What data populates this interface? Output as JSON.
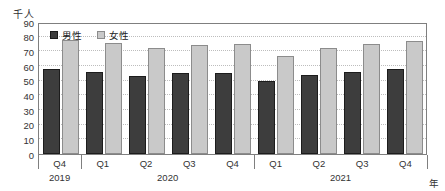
{
  "figure": {
    "unit_label": "千人",
    "axis_unit_label": "年"
  },
  "legend": {
    "items": [
      {
        "label": "男性",
        "color": "#3d3d3d",
        "border": "#1c1c1c"
      },
      {
        "label": "女性",
        "color": "#c9c9c9",
        "border": "#8c8c8c"
      }
    ]
  },
  "chart_data": {
    "type": "bar",
    "title": "",
    "ylabel": "千人",
    "xlabel": "年",
    "ylim": [
      0,
      90
    ],
    "ytick_step": 10,
    "grid": true,
    "legend_position": "top-left-inside",
    "categories": [
      "Q4",
      "Q1",
      "Q2",
      "Q3",
      "Q4",
      "Q1",
      "Q2",
      "Q3",
      "Q4"
    ],
    "year_groups": [
      {
        "label": "2019",
        "span": 1
      },
      {
        "label": "2020",
        "span": 4
      },
      {
        "label": "2021",
        "span": 4
      }
    ],
    "series": [
      {
        "name": "男性",
        "values": [
          58,
          56,
          53,
          55,
          55,
          50,
          54,
          56,
          58
        ]
      },
      {
        "name": "女性",
        "values": [
          78,
          76,
          72,
          74,
          75,
          67,
          72,
          75,
          77
        ]
      }
    ]
  }
}
